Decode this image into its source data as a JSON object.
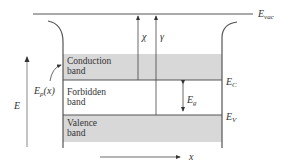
{
  "diagram": {
    "colors": {
      "band_fill": "#d8d8d8",
      "line": "#555555",
      "axis": "#888888",
      "background": "#ffffff"
    },
    "labels": {
      "e_vac": "E",
      "e_vac_sub": "vac",
      "chi": "χ",
      "gamma": "γ",
      "e_p": "E",
      "e_p_sub": "p",
      "e_p_arg": "(x)",
      "e_axis": "E",
      "e_c": "E",
      "e_c_sub": "C",
      "e_v": "E",
      "e_v_sub": "V",
      "e_g": "E",
      "e_g_sub": "g",
      "x_axis": "x"
    },
    "bands": {
      "conduction": [
        "Conduction",
        "band"
      ],
      "forbidden": [
        "Forbidden",
        "band"
      ],
      "valence": [
        "Valence",
        "band"
      ]
    }
  }
}
